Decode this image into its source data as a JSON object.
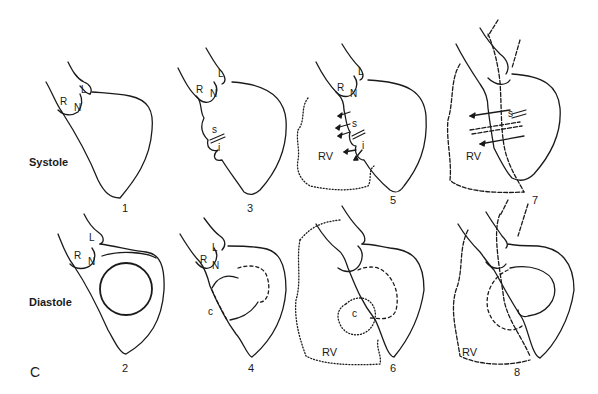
{
  "figure": {
    "panel_letter": "C",
    "rows": {
      "systole": "Systole",
      "diastole": "Diastole"
    },
    "panels": [
      {
        "number": "1",
        "phase": "Systole",
        "labels": [
          "R",
          "N",
          "L"
        ]
      },
      {
        "number": "2",
        "phase": "Diastole",
        "labels": [
          "R",
          "N",
          "L"
        ]
      },
      {
        "number": "3",
        "phase": "Systole",
        "labels": [
          "R",
          "N",
          "L",
          "s",
          "i"
        ]
      },
      {
        "number": "4",
        "phase": "Diastole",
        "labels": [
          "R",
          "N",
          "L",
          "c"
        ]
      },
      {
        "number": "5",
        "phase": "Systole",
        "labels": [
          "R",
          "N",
          "L",
          "s",
          "i",
          "RV"
        ]
      },
      {
        "number": "6",
        "phase": "Diastole",
        "labels": [
          "c",
          "RV"
        ]
      },
      {
        "number": "7",
        "phase": "Systole",
        "labels": [
          "s",
          "RV"
        ]
      },
      {
        "number": "8",
        "phase": "Diastole",
        "labels": [
          "RV"
        ]
      }
    ],
    "cusp_labels": {
      "right": "R",
      "noncoronary": "N",
      "left": "L"
    },
    "structure_labels": {
      "s": "s",
      "i": "i",
      "c": "c",
      "rv": "RV"
    },
    "colors": {
      "line": "#1a1a1a",
      "background": "#ffffff"
    }
  }
}
